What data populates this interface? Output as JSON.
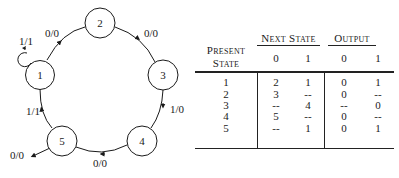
{
  "diagram": {
    "states": [
      {
        "id": "1",
        "label": "1"
      },
      {
        "id": "2",
        "label": "2"
      },
      {
        "id": "3",
        "label": "3"
      },
      {
        "id": "4",
        "label": "4"
      },
      {
        "id": "5",
        "label": "5"
      }
    ],
    "transitions": [
      {
        "from": "1",
        "to": "1",
        "label": "1/1"
      },
      {
        "from": "1",
        "to": "2",
        "label": "0/0"
      },
      {
        "from": "2",
        "to": "3",
        "label": "0/0"
      },
      {
        "from": "3",
        "to": "4",
        "label": "1/0"
      },
      {
        "from": "4",
        "to": "5",
        "label": "0/0"
      },
      {
        "from": "5",
        "to": "1",
        "label": "1/1"
      },
      {
        "from": "5",
        "to": "out",
        "label": "0/0"
      }
    ]
  },
  "table": {
    "present_state_header_line1": "Present",
    "present_state_header_line2": "State",
    "next_state_header": "Next State",
    "output_header": "Output",
    "subheaders": {
      "next_0": "0",
      "next_1": "1",
      "out_0": "0",
      "out_1": "1"
    },
    "rows": [
      {
        "state": "1",
        "next_0": "2",
        "next_1": "1",
        "out_0": "0",
        "out_1": "1"
      },
      {
        "state": "2",
        "next_0": "3",
        "next_1": "--",
        "out_0": "0",
        "out_1": "--"
      },
      {
        "state": "3",
        "next_0": "--",
        "next_1": "4",
        "out_0": "--",
        "out_1": "0"
      },
      {
        "state": "4",
        "next_0": "5",
        "next_1": "--",
        "out_0": "0",
        "out_1": "--"
      },
      {
        "state": "5",
        "next_0": "--",
        "next_1": "1",
        "out_0": "0",
        "out_1": "1"
      }
    ]
  }
}
